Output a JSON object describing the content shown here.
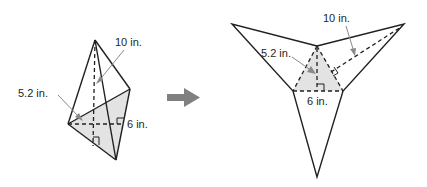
{
  "figure": {
    "pyramid": {
      "slant_height_label": "10 in.",
      "base_height_label": "5.2 in.",
      "base_edge_label": "6 in."
    },
    "net": {
      "slant_height_label": "10 in.",
      "base_height_label": "5.2 in.",
      "base_edge_label": "6 in."
    },
    "arrow": "right-arrow",
    "colors": {
      "line": "#231f20",
      "shade": "#e3e3e3",
      "leader": "#8a8a8a",
      "arrow": "#808080"
    }
  }
}
